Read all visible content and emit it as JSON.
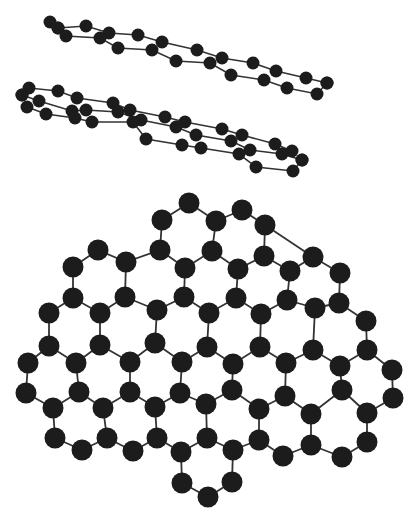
{
  "diagram": {
    "type": "molecular-structure",
    "colors": {
      "atom": "#1c1c1c",
      "bond": "#333333",
      "background": "#ffffff"
    },
    "stacked_sheets": [
      {
        "name": "sheet-top",
        "atom_radius": 6.5,
        "rows": [
          [
            [
              50,
              22
            ],
            [
              58,
              28
            ],
            [
              86,
              26
            ],
            [
              109,
              33
            ],
            [
              138,
              35
            ],
            [
              162,
              42
            ],
            [
              197,
              50
            ],
            [
              222,
              58
            ],
            [
              253,
              63
            ],
            [
              276,
              71
            ],
            [
              306,
              78
            ],
            [
              327,
              83
            ]
          ],
          [
            [
              58,
              28
            ],
            [
              66,
              36
            ],
            [
              100,
              38
            ],
            [
              118,
              48
            ],
            [
              152,
              50
            ],
            [
              176,
              61
            ],
            [
              210,
              63
            ],
            [
              231,
              75
            ],
            [
              264,
              80
            ],
            [
              287,
              88
            ],
            [
              317,
              94
            ],
            [
              327,
              83
            ]
          ]
        ]
      },
      {
        "name": "sheet-bottom",
        "atom_radius": 6.5,
        "rows": [
          [
            [
              22,
              95
            ],
            [
              29,
              88
            ],
            [
              58,
              91
            ],
            [
              77,
              98
            ],
            [
              113,
              103
            ],
            [
              130,
              110
            ],
            [
              165,
              117
            ],
            [
              185,
              122
            ],
            [
              222,
              129
            ],
            [
              242,
              135
            ],
            [
              275,
              144
            ],
            [
              292,
              151
            ]
          ],
          [
            [
              22,
              95
            ],
            [
              39,
              101
            ],
            [
              72,
              111
            ],
            [
              86,
              110
            ],
            [
              118,
              112
            ],
            [
              141,
              120
            ],
            [
              176,
              127
            ],
            [
              196,
              135
            ],
            [
              231,
              141
            ],
            [
              250,
              150
            ],
            [
              282,
              154
            ],
            [
              302,
              160
            ]
          ],
          [
            [
              27,
              107
            ],
            [
              46,
              114
            ],
            [
              75,
              118
            ],
            [
              92,
              122
            ],
            [
              133,
              122
            ],
            [
              146,
              139
            ],
            [
              182,
              145
            ],
            [
              201,
              148
            ],
            [
              239,
              154
            ],
            [
              256,
              167
            ],
            [
              293,
              171
            ],
            [
              302,
              160
            ]
          ]
        ]
      }
    ],
    "lattice": {
      "name": "graphene-lattice",
      "atom_radius": 10.5,
      "atoms": [
        [
          189,
          203
        ],
        [
          242,
          210
        ],
        [
          162,
          220
        ],
        [
          216,
          221
        ],
        [
          265,
          225
        ],
        [
          98,
          250
        ],
        [
          160,
          250
        ],
        [
          212,
          251
        ],
        [
          264,
          256
        ],
        [
          313,
          257
        ],
        [
          73,
          267
        ],
        [
          126,
          262
        ],
        [
          185,
          268
        ],
        [
          238,
          269
        ],
        [
          290,
          271
        ],
        [
          340,
          273
        ],
        [
          73,
          298
        ],
        [
          125,
          297
        ],
        [
          184,
          297
        ],
        [
          236,
          298
        ],
        [
          287,
          300
        ],
        [
          339,
          303
        ],
        [
          49,
          313
        ],
        [
          100,
          313
        ],
        [
          157,
          310
        ],
        [
          209,
          313
        ],
        [
          261,
          314
        ],
        [
          315,
          308
        ],
        [
          366,
          321
        ],
        [
          49,
          346
        ],
        [
          100,
          345
        ],
        [
          155,
          343
        ],
        [
          207,
          347
        ],
        [
          260,
          347
        ],
        [
          313,
          350
        ],
        [
          367,
          350
        ],
        [
          28,
          363
        ],
        [
          76,
          363
        ],
        [
          130,
          362
        ],
        [
          182,
          362
        ],
        [
          233,
          364
        ],
        [
          286,
          363
        ],
        [
          340,
          366
        ],
        [
          392,
          370
        ],
        [
          26,
          393
        ],
        [
          79,
          392
        ],
        [
          130,
          392
        ],
        [
          180,
          393
        ],
        [
          232,
          390
        ],
        [
          285,
          396
        ],
        [
          342,
          390
        ],
        [
          393,
          398
        ],
        [
          53,
          408
        ],
        [
          103,
          408
        ],
        [
          155,
          407
        ],
        [
          206,
          404
        ],
        [
          259,
          409
        ],
        [
          311,
          414
        ],
        [
          367,
          413
        ],
        [
          55,
          438
        ],
        [
          107,
          438
        ],
        [
          157,
          438
        ],
        [
          207,
          438
        ],
        [
          259,
          440
        ],
        [
          311,
          445
        ],
        [
          367,
          442
        ],
        [
          82,
          450
        ],
        [
          133,
          451
        ],
        [
          181,
          452
        ],
        [
          233,
          450
        ],
        [
          283,
          456
        ],
        [
          342,
          457
        ],
        [
          182,
          483
        ],
        [
          232,
          482
        ],
        [
          208,
          497
        ]
      ],
      "bonds": [
        [
          0,
          2
        ],
        [
          0,
          3
        ],
        [
          1,
          3
        ],
        [
          1,
          4
        ],
        [
          2,
          6
        ],
        [
          3,
          7
        ],
        [
          4,
          8
        ],
        [
          6,
          11
        ],
        [
          6,
          12
        ],
        [
          7,
          12
        ],
        [
          7,
          13
        ],
        [
          8,
          13
        ],
        [
          8,
          14
        ],
        [
          9,
          14
        ],
        [
          9,
          15
        ],
        [
          4,
          9
        ],
        [
          5,
          10
        ],
        [
          5,
          11
        ],
        [
          10,
          16
        ],
        [
          11,
          17
        ],
        [
          12,
          18
        ],
        [
          13,
          19
        ],
        [
          14,
          20
        ],
        [
          15,
          21
        ],
        [
          16,
          22
        ],
        [
          16,
          23
        ],
        [
          17,
          23
        ],
        [
          17,
          24
        ],
        [
          18,
          24
        ],
        [
          18,
          25
        ],
        [
          19,
          25
        ],
        [
          19,
          26
        ],
        [
          20,
          26
        ],
        [
          20,
          27
        ],
        [
          21,
          27
        ],
        [
          21,
          28
        ],
        [
          22,
          29
        ],
        [
          23,
          30
        ],
        [
          24,
          31
        ],
        [
          25,
          32
        ],
        [
          26,
          33
        ],
        [
          27,
          34
        ],
        [
          28,
          35
        ],
        [
          29,
          36
        ],
        [
          29,
          37
        ],
        [
          30,
          37
        ],
        [
          30,
          38
        ],
        [
          31,
          38
        ],
        [
          31,
          39
        ],
        [
          32,
          39
        ],
        [
          32,
          40
        ],
        [
          33,
          40
        ],
        [
          33,
          41
        ],
        [
          34,
          41
        ],
        [
          34,
          42
        ],
        [
          35,
          42
        ],
        [
          35,
          43
        ],
        [
          36,
          44
        ],
        [
          37,
          45
        ],
        [
          38,
          46
        ],
        [
          39,
          47
        ],
        [
          40,
          48
        ],
        [
          41,
          49
        ],
        [
          42,
          50
        ],
        [
          43,
          51
        ],
        [
          44,
          52
        ],
        [
          45,
          52
        ],
        [
          45,
          53
        ],
        [
          46,
          53
        ],
        [
          46,
          54
        ],
        [
          47,
          54
        ],
        [
          47,
          55
        ],
        [
          48,
          55
        ],
        [
          48,
          56
        ],
        [
          49,
          56
        ],
        [
          49,
          57
        ],
        [
          50,
          57
        ],
        [
          50,
          58
        ],
        [
          51,
          58
        ],
        [
          52,
          59
        ],
        [
          53,
          60
        ],
        [
          54,
          61
        ],
        [
          55,
          62
        ],
        [
          56,
          63
        ],
        [
          57,
          64
        ],
        [
          58,
          65
        ],
        [
          59,
          66
        ],
        [
          60,
          66
        ],
        [
          60,
          67
        ],
        [
          61,
          67
        ],
        [
          61,
          68
        ],
        [
          62,
          68
        ],
        [
          62,
          69
        ],
        [
          63,
          69
        ],
        [
          63,
          70
        ],
        [
          64,
          70
        ],
        [
          64,
          71
        ],
        [
          65,
          71
        ],
        [
          68,
          72
        ],
        [
          69,
          73
        ],
        [
          72,
          74
        ],
        [
          73,
          74
        ]
      ]
    }
  }
}
